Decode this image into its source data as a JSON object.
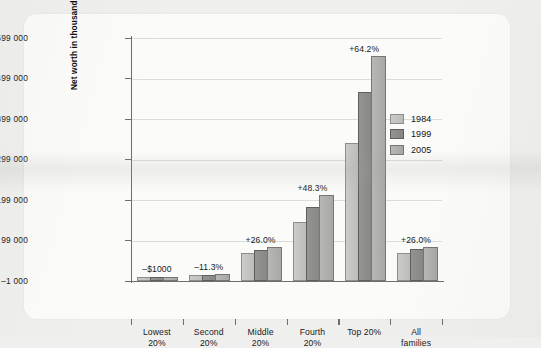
{
  "chart_data": {
    "type": "bar",
    "title": "",
    "xlabel": "",
    "ylabel": "Net worth in thousands (in 2005 dollars)",
    "categories": [
      "Lowest\n20%",
      "Second\n20%",
      "Middle\n20%",
      "Fourth\n20%",
      "Top 20%",
      "All\nfamilies"
    ],
    "legend_position": "inside-top-center",
    "grid": true,
    "ylim": [
      -1000,
      599000
    ],
    "yticks": [
      -1000,
      99000,
      199000,
      299000,
      399000,
      499000,
      599000
    ],
    "ytick_labels": [
      "–1 000",
      "99 000",
      "199 000",
      "299 000",
      "399 000",
      "499 000",
      "599 000"
    ],
    "series": [
      {
        "name": "1984",
        "color": "#c4c4c2",
        "values": [
          1000,
          10000,
          63000,
          139000,
          335000,
          63000
        ]
      },
      {
        "name": "1999",
        "color": "#8c8c8a",
        "values": [
          1000,
          10000,
          70000,
          176000,
          460000,
          72000
        ]
      },
      {
        "name": "2005",
        "color": "#aeaeac",
        "values": [
          1000,
          11000,
          79000,
          207000,
          550000,
          79000
        ]
      }
    ],
    "annotations": [
      "–$1000",
      "–11.3%",
      "+26.0%",
      "+48.3%",
      "+64.2%",
      "+26.0%"
    ]
  },
  "legend": {
    "items": [
      {
        "label": "1984"
      },
      {
        "label": "1999"
      },
      {
        "label": "2005"
      }
    ]
  }
}
